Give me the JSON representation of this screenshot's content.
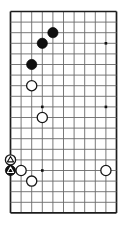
{
  "figure": {
    "name": "go-board-diagram",
    "type": "go-board",
    "background_color": "#ffffff",
    "line_color": "#6a6a6a",
    "edge_color": "#1c1c1c",
    "black_color": "#101010",
    "white_color": "#ffffff",
    "caption": ""
  },
  "board": {
    "columns": 11,
    "rows": 20,
    "cell_size": 10.6,
    "origin_x": 10.5,
    "origin_y": 11.5,
    "left_edge_is_board_edge": true,
    "bottom_edge_is_board_edge": true,
    "top_edge_is_board_edge": true,
    "right_edge_is_board_edge": true
  },
  "star_points": [
    {
      "col": 9,
      "row": 3,
      "label": "star-point-upper-right"
    },
    {
      "col": 3,
      "row": 9,
      "label": "star-point-middle-left"
    },
    {
      "col": 9,
      "row": 9,
      "label": "star-point-middle-right"
    },
    {
      "col": 3,
      "row": 15,
      "label": "star-point-lower-left"
    }
  ],
  "stones": [
    {
      "id": "b1",
      "color": "black",
      "col": 4,
      "row": 2,
      "mark": "none",
      "label": "black-stone-upper"
    },
    {
      "id": "b2",
      "color": "black",
      "col": 3,
      "row": 3,
      "mark": "none",
      "label": "black-stone-middle"
    },
    {
      "id": "b3",
      "color": "black",
      "col": 2,
      "row": 5,
      "mark": "none",
      "label": "black-stone-lower"
    },
    {
      "id": "w1",
      "color": "white",
      "col": 2,
      "row": 7,
      "mark": "none",
      "label": "white-stone-upper"
    },
    {
      "id": "w2",
      "color": "white",
      "col": 3,
      "row": 10,
      "mark": "none",
      "label": "white-stone-center"
    },
    {
      "id": "w3",
      "color": "white",
      "col": 0,
      "row": 14,
      "mark": "triangle",
      "label": "white-stone-marked"
    },
    {
      "id": "b4",
      "color": "black",
      "col": 0,
      "row": 15,
      "mark": "triangle",
      "label": "black-stone-marked"
    },
    {
      "id": "w4",
      "color": "white",
      "col": 1,
      "row": 15,
      "mark": "none",
      "label": "white-stone-edge"
    },
    {
      "id": "w5",
      "color": "white",
      "col": 2,
      "row": 16,
      "mark": "none",
      "label": "white-stone-bottom"
    },
    {
      "id": "w6",
      "color": "white",
      "col": 9,
      "row": 15,
      "mark": "none",
      "label": "white-stone-right"
    }
  ],
  "stone_radius": 5.1
}
